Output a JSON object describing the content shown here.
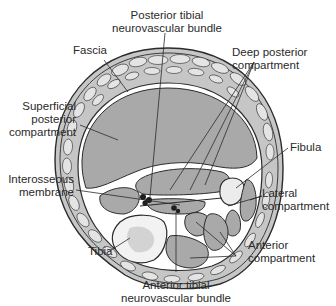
{
  "figure": {
    "colors": {
      "outline": "#2b2b2b",
      "muscle_fill": "#a9a9a9",
      "fat_fill": "#c6c6c6",
      "bone_fill": "#ececec",
      "bundle_fill": "#1e1e1e",
      "background": "#ffffff"
    }
  },
  "labels": {
    "posterior_tibial": {
      "line1": "Posterior tibial",
      "line2": "neurovascular bundle"
    },
    "fascia": {
      "line1": "Fascia"
    },
    "deep_posterior": {
      "line1": "Deep posterior",
      "line2": "compartment"
    },
    "superficial_posterior": {
      "line1": "Superficial",
      "line2": "posterior",
      "line3": "compartment"
    },
    "fibula": {
      "line1": "Fibula"
    },
    "interosseous": {
      "line1": "Interosseous",
      "line2": "membrane"
    },
    "lateral": {
      "line1": "Lateral",
      "line2": "compartment"
    },
    "tibia": {
      "line1": "Tibia"
    },
    "anterior": {
      "line1": "Anterior",
      "line2": "compartment"
    },
    "anterior_tibial": {
      "line1": "Anterior tibial",
      "line2": "neurovascular bundle"
    }
  }
}
